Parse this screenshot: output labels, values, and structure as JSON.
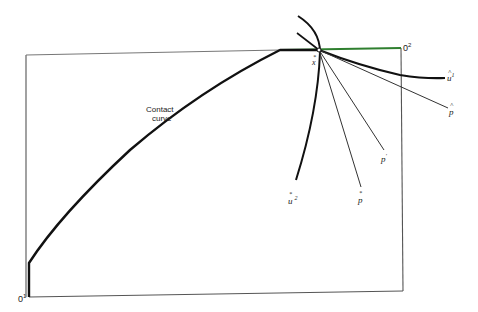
{
  "diagram": {
    "type": "edgeworth-box",
    "labels": {
      "contact_curve_line1": "Contact",
      "contact_curve_line2": "curve",
      "origin1": "0",
      "origin1_sup": "1",
      "origin2": "0",
      "origin2_sup": "2",
      "x_star": "x",
      "u1_hat": "u",
      "u1_hat_sup": "1",
      "p_hat": "p",
      "p_prime": "p",
      "p_star": "p",
      "u2_star": "u",
      "u2_star_sup": "2"
    },
    "marks": {
      "star": "*",
      "hat": "^",
      "prime": "′"
    },
    "colors": {
      "box_line": "#555555",
      "curve": "#111111",
      "thin_line": "#333333",
      "top_edge_tint": "#3a8a3a"
    }
  }
}
